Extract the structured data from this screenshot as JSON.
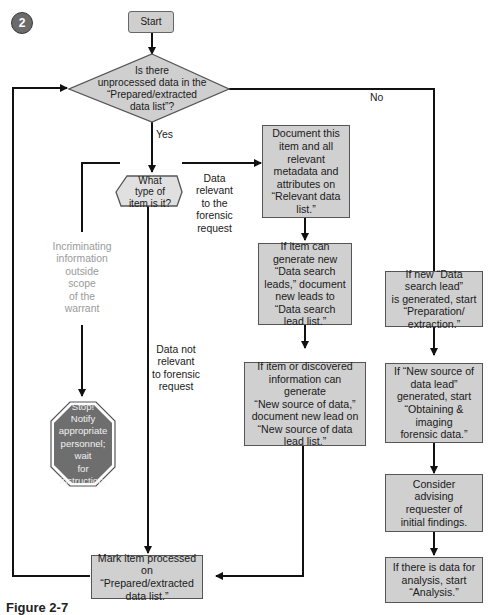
{
  "badge": {
    "number": "2"
  },
  "nodes": {
    "start": "Start",
    "decision_unprocessed": [
      "Is there",
      "unprocessed data in the",
      "“Prepared/extracted",
      "data list”?"
    ],
    "decision_item_type": [
      "What",
      "type of",
      "item is it?"
    ],
    "document_item": [
      "Document this",
      "item and all",
      "relevant",
      "metadata and",
      "attributes on",
      "“Relevant data",
      "list.”"
    ],
    "search_leads": [
      "If item can",
      "generate new",
      "“Data search",
      "leads,” document",
      "new leads to",
      "“Data search",
      "lead list.”"
    ],
    "new_source": [
      "If item or discovered",
      "information can generate",
      "“New source of data,”",
      "document new lead on",
      "“New source of data",
      "lead list.”"
    ],
    "stop": [
      "Stop!",
      "Notify",
      "appropriate",
      "personnel; wait",
      "for instruction."
    ],
    "mark_processed": [
      "Mark item processed on",
      "“Prepared/extracted",
      "data list.”"
    ],
    "start_preparation": [
      "If new “Data",
      "search lead”",
      "is generated, start",
      "“Preparation/",
      "extraction.”"
    ],
    "start_obtaining": [
      "If “New source of",
      "data lead”",
      "generated, start",
      "“Obtaining &",
      "imaging",
      "forensic data.”"
    ],
    "consider_advising": [
      "Consider",
      "advising",
      "requester of",
      "initial findings."
    ],
    "start_analysis": [
      "If there is data for",
      "analysis, start",
      "“Analysis.”"
    ]
  },
  "edge_labels": {
    "yes": "Yes",
    "no": "No",
    "relevant": [
      "Data",
      "relevant",
      "to the",
      "forensic",
      "request"
    ],
    "not_relevant": [
      "Data not",
      "relevant",
      "to forensic",
      "request"
    ],
    "incriminating": [
      "Incriminating",
      "information",
      "outside",
      "scope",
      "of the",
      "warrant"
    ]
  },
  "caption": "Figure 2-7"
}
